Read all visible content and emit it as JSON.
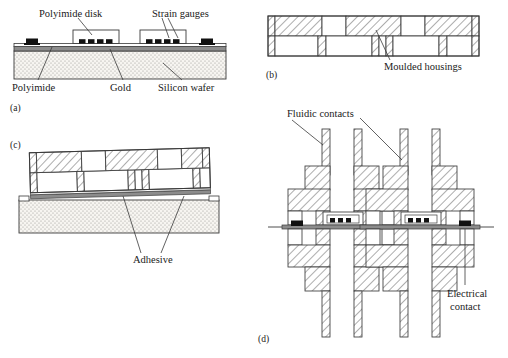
{
  "figure": {
    "panels": [
      {
        "id": "a",
        "letter": "(a)",
        "title": "silicon-wafer-with-strain-gauges",
        "labels": [
          {
            "name": "polyimide-disk",
            "text": "Polyimide disk"
          },
          {
            "name": "strain-gauges",
            "text": "Strain gauges"
          },
          {
            "name": "polyimide",
            "text": "Polyimide"
          },
          {
            "name": "gold",
            "text": "Gold"
          },
          {
            "name": "silicon-wafer",
            "text": "Silicon wafer"
          }
        ]
      },
      {
        "id": "b",
        "letter": "(b)",
        "title": "moulded-housings-cross-section",
        "labels": [
          {
            "name": "moulded-housings",
            "text": "Moulded housings"
          }
        ]
      },
      {
        "id": "c",
        "letter": "(c)",
        "title": "housing-bonded-to-wafer",
        "labels": [
          {
            "name": "adhesive",
            "text": "Adhesive"
          }
        ]
      },
      {
        "id": "d",
        "letter": "(d)",
        "title": "assembled-device-with-contacts",
        "labels": [
          {
            "name": "fluidic-contacts",
            "text": "Fluidic contacts"
          },
          {
            "name": "electrical-contact-line1",
            "text": "Electrical"
          },
          {
            "name": "electrical-contact-line2",
            "text": "contact"
          }
        ]
      }
    ],
    "colors": {
      "line": "#3a3a3a",
      "hatch": "#4a4a4a",
      "gold_layer": "#8c8c8c",
      "contact_pad": "#111111",
      "wafer_fill": "#f2f0ec",
      "white": "#ffffff"
    }
  }
}
